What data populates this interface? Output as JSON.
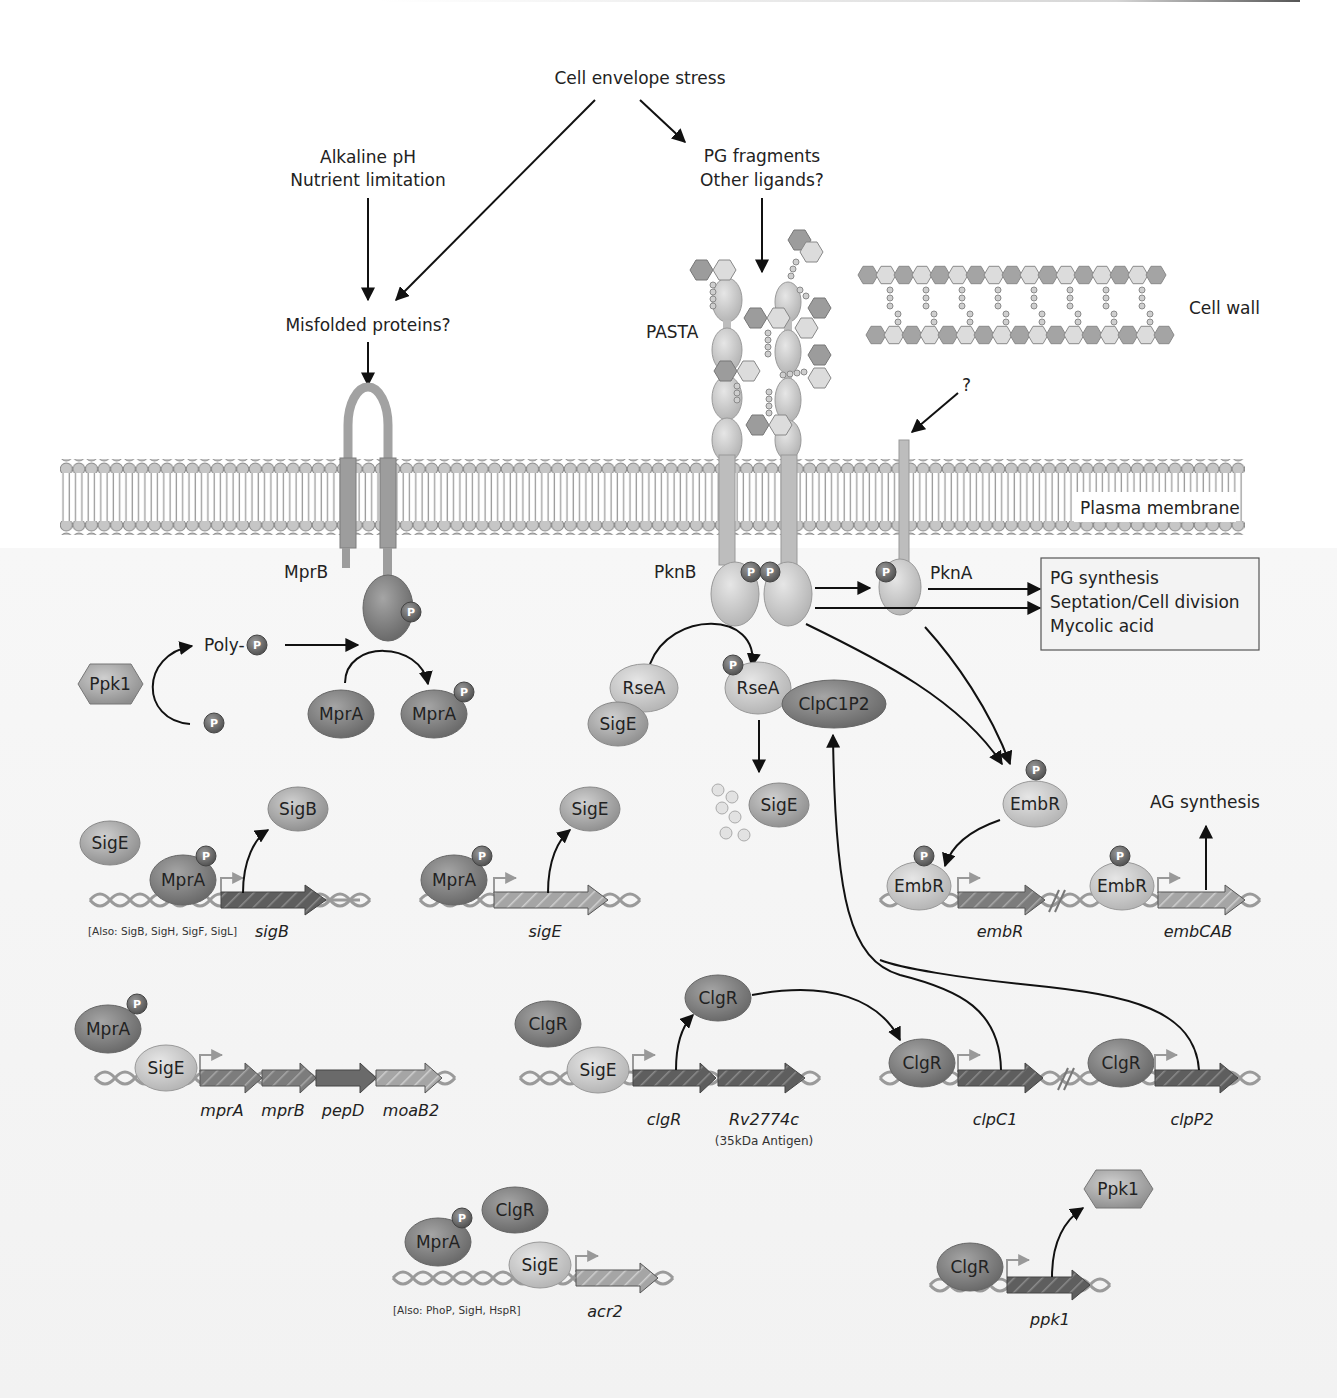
{
  "colors": {
    "background": "#ffffff",
    "membrane_head": "#bdbdbd",
    "protein_dark": "#7d7d7d",
    "protein_mid": "#a9a9a9",
    "protein_light": "#cfcfcf",
    "phospho": "#6e6e6e",
    "dna": "#9a9a9a",
    "gene_dark": "#5a5a5a",
    "gene_light": "#b0b0b0",
    "arrow": "#111111"
  },
  "stimuli": {
    "cell_envelope_stress": "Cell envelope stress",
    "alkaline_ph": "Alkaline pH",
    "nutrient_limitation": "Nutrient limitation",
    "pg_fragments": "PG fragments",
    "other_ligands": "Other ligands?",
    "misfolded_proteins": "Misfolded proteins?",
    "unknown": "?"
  },
  "structures": {
    "cell_wall": "Cell wall",
    "plasma_membrane": "Plasma membrane",
    "pasta": "PASTA"
  },
  "kinases": {
    "mprb": "MprB",
    "pknb": "PknB",
    "pkna": "PknA",
    "phospho": "P"
  },
  "outputs_box": {
    "lines": [
      "PG synthesis",
      "Septation/Cell division",
      "Mycolic acid"
    ]
  },
  "proteins": {
    "ppk1": "Ppk1",
    "poly_p": "Poly-",
    "mpra": "MprA",
    "rsea": "RseA",
    "sige": "SigE",
    "sigb": "SigB",
    "clpc1p2": "ClpC1P2",
    "embr": "EmbR",
    "clgr": "ClgR"
  },
  "outcomes": {
    "ag_synthesis": "AG synthesis"
  },
  "genes": {
    "sigb": "sigB",
    "sige": "sigE",
    "embr": "embR",
    "embcab": "embCAB",
    "mpra": "mprA",
    "mprb": "mprB",
    "pepd": "pepD",
    "moab2": "moaB2",
    "clgr": "clgR",
    "rv2774c": "Rv2774c",
    "rv2774c_note": "(35kDa Antigen)",
    "clpc1": "clpC1",
    "clpp2": "clpP2",
    "acr2": "acr2",
    "ppk1": "ppk1"
  },
  "notes": {
    "sigb_also": "[Also: SigB, SigH, SigF, SigL]",
    "acr2_also": "[Also: PhoP, SigH, HspR]"
  }
}
